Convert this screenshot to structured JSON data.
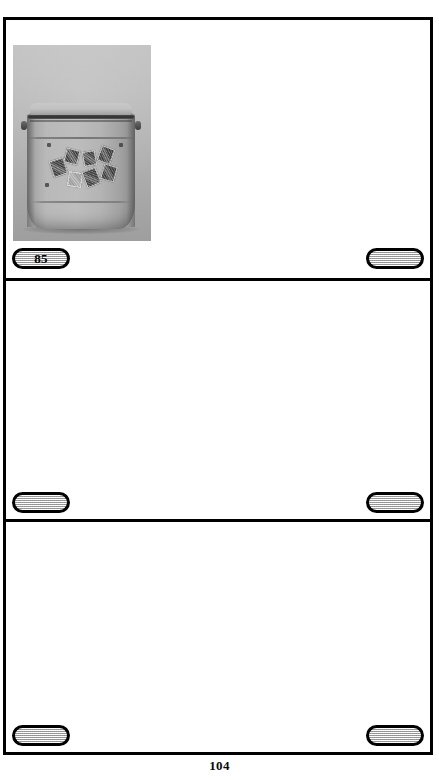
{
  "document": {
    "page_number": "104",
    "background_color": "#ffffff",
    "ink_color": "#000000"
  },
  "panels": [
    {
      "id": "panel-1",
      "has_photo": true,
      "photo": {
        "alt_name": "handbag-photograph",
        "subject": "grey leather shoulder bag decorated with postage stamps",
        "tone": "grayscale",
        "background_color": "#b4b4b4",
        "bag_color": "#bdbdbd"
      },
      "tags": [
        {
          "position": "left",
          "label": "85",
          "fill": "#c9c9c9"
        },
        {
          "position": "right",
          "label": "",
          "fill": "#c9c9c9"
        }
      ]
    },
    {
      "id": "panel-2",
      "has_photo": false,
      "tags": [
        {
          "position": "left",
          "label": "",
          "fill": "#c9c9c9"
        },
        {
          "position": "right",
          "label": "",
          "fill": "#c9c9c9"
        }
      ]
    },
    {
      "id": "panel-3",
      "has_photo": false,
      "tags": [
        {
          "position": "left",
          "label": "",
          "fill": "#c9c9c9"
        },
        {
          "position": "right",
          "label": "",
          "fill": "#c9c9c9"
        }
      ]
    }
  ]
}
